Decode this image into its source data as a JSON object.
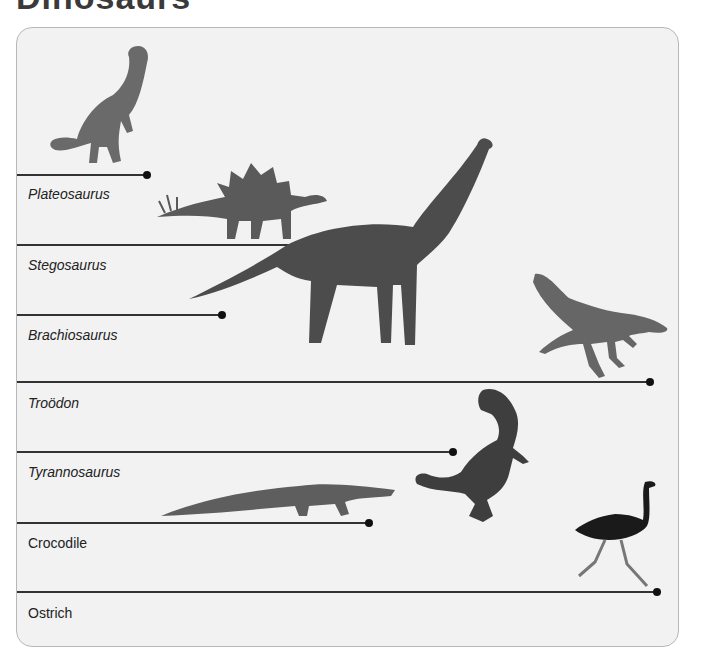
{
  "title": "Dinosaurs",
  "rows": [
    {
      "label": "Plateosaurus",
      "italic": true,
      "line_y": 147,
      "line_end_x": 130
    },
    {
      "label": "Stegosaurus",
      "italic": true,
      "line_y": 217,
      "line_end_x": 301
    },
    {
      "label": "Brachiosaurus",
      "italic": true,
      "line_y": 287,
      "line_end_x": 205
    },
    {
      "label": "Troödon",
      "italic": true,
      "line_y": 354,
      "line_end_x": 633
    },
    {
      "label": "Tyrannosaurus",
      "italic": true,
      "line_y": 424,
      "line_end_x": 436
    },
    {
      "label": "Crocodile",
      "italic": false,
      "line_y": 495,
      "line_end_x": 352
    },
    {
      "label": "Ostrich",
      "italic": false,
      "line_y": 564,
      "line_end_x": 640
    }
  ],
  "animals": [
    {
      "name": "plateosaurus"
    },
    {
      "name": "stegosaurus"
    },
    {
      "name": "brachiosaurus"
    },
    {
      "name": "troodon"
    },
    {
      "name": "tyrannosaurus"
    },
    {
      "name": "crocodile"
    },
    {
      "name": "ostrich"
    }
  ],
  "colors": {
    "card_bg": "#f2f2f2",
    "line": "#333333",
    "dot": "#111111",
    "animal": "#555555",
    "ostrich_body": "#1a1a1a"
  }
}
